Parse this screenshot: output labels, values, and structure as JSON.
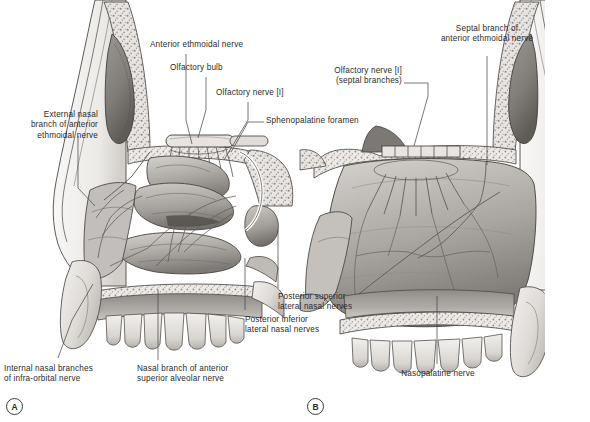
{
  "figure": {
    "background_color": "#ffffff",
    "text_color": "#2b2b2b",
    "panels": [
      {
        "tag": "A",
        "description": "Lateral wall of nasal cavity"
      },
      {
        "tag": "B",
        "description": "Nasal septum"
      }
    ]
  },
  "labels": {
    "external_nasal_branch": "External nasal\nbranch of anterior\nethmoidal nerve",
    "anterior_ethmoidal_nerve": "Anterior ethmoidal nerve",
    "olfactory_bulb": "Olfactory bulb",
    "olfactory_nerve_I": "Olfactory nerve [I]",
    "sphenopalatine_foramen": "Sphenopalatine foramen",
    "septal_branch": "Septal branch of\nanterior ethmoidal nerve",
    "olfactory_nerve_septal": "Olfactory nerve [I]\n(septal branches)",
    "posterior_superior_lateral": "Posterior superior\nlateral nasal nerves",
    "posterior_inferior_lateral": "Posterior inferior\nlateral nasal nerves",
    "internal_nasal_branches": "Internal nasal branches\nof infra-orbital nerve",
    "nasal_branch_anterior_superior": "Nasal branch of anterior\nsuperior alveolar nerve",
    "nasopalatine_nerve": "Nasopalatine nerve",
    "panel_a": "A",
    "panel_b": "B"
  },
  "palette": {
    "outline": "#3a3a3a",
    "leader": "#4a4a4a",
    "bone_light": "#e9e7e4",
    "bone_mid": "#cfccc8",
    "bone_dark": "#a9a5a1",
    "mucosa_light": "#c8c4c0",
    "mucosa_mid": "#a8a4a0",
    "mucosa_dark": "#807c78",
    "cavity": "#6e6a66",
    "tooth": "#e4e2df",
    "nerve": "#6a6663"
  }
}
